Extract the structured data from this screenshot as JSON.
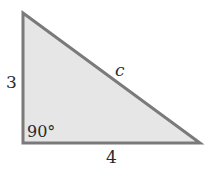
{
  "diagram": {
    "side_vertical": "3",
    "side_horizontal": "4",
    "hypotenuse": "c",
    "right_angle": "90°",
    "colors": {
      "fill": "#e6e6e6",
      "stroke": "#7a7a7a",
      "text": "#2a2a2a"
    }
  }
}
